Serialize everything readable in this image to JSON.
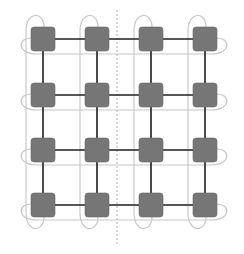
{
  "diagram": {
    "type": "2D torus interconnect (4x4)",
    "rows": 4,
    "cols": 4,
    "node_size": 24,
    "node_radius": 3,
    "col_x": [
      43,
      97,
      151,
      205
    ],
    "row_y": [
      39,
      95,
      150,
      205
    ],
    "divider_x": 117,
    "colors": {
      "node_fill": "#767676",
      "mesh_link": "#1e1e1e",
      "wrap_link": "#c8c8c8",
      "divider": "#b4b4b4",
      "background": "#ffffff"
    },
    "links": {
      "mesh": "black straight links between horizontally and vertically adjacent nodes",
      "wraparound": "light gray looped links connecting first and last node of each row and column",
      "divider": "dashed vertical partition line between columns 2 and 3"
    }
  }
}
